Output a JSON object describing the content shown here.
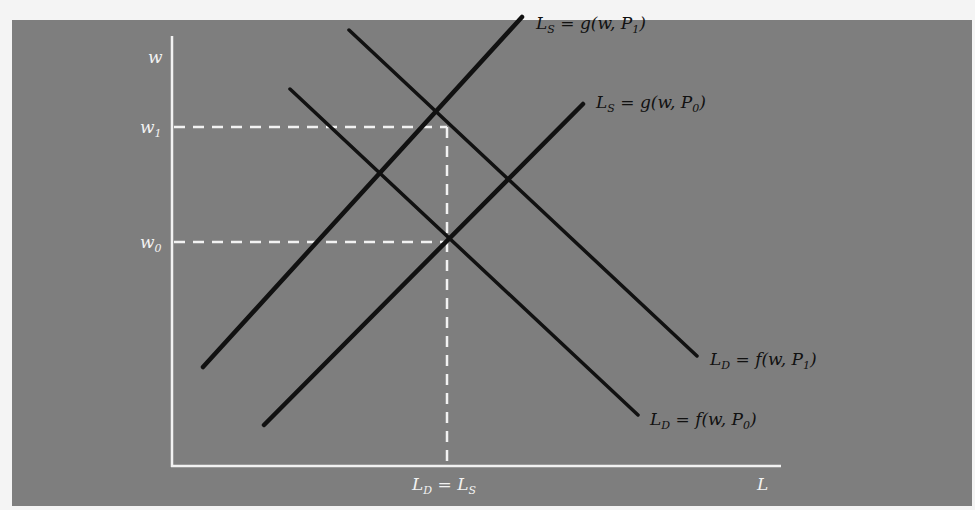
{
  "diagram": {
    "colors": {
      "page_background": "#f4f4f4",
      "panel_background": "#7e7e7e",
      "axis_color": "#f2f2f2",
      "curve_color": "#111111",
      "guide_line_color": "#f2f2f2"
    },
    "axes": {
      "y_label": "w",
      "x_label": "L",
      "y_ticks": [
        {
          "base": "w",
          "sub": "1",
          "y": 127
        },
        {
          "base": "w",
          "sub": "0",
          "y": 242
        }
      ],
      "x_ticks": [
        {
          "text": "L_D = L_S",
          "lhs_base": "L",
          "lhs_sub": "D",
          "eq": " = ",
          "rhs_base": "L",
          "rhs_sub": "S",
          "x": 447
        }
      ]
    },
    "curves": [
      {
        "id": "supply-p1",
        "label_lhs": "L",
        "label_lhs_sub": "S",
        "label_rhs": " = g(w, P",
        "label_rhs_sub": "1",
        "close": ")",
        "x1": 203,
        "y1": 367,
        "x2": 522,
        "y2": 17
      },
      {
        "id": "supply-p0",
        "label_lhs": "L",
        "label_lhs_sub": "S",
        "label_rhs": " = g(w, P",
        "label_rhs_sub": "0",
        "close": ")",
        "x1": 264,
        "y1": 425,
        "x2": 583,
        "y2": 104
      },
      {
        "id": "demand-p1",
        "label_lhs": "L",
        "label_lhs_sub": "D",
        "label_rhs": " = f(w, P",
        "label_rhs_sub": "1",
        "close": ")",
        "x1": 349,
        "y1": 30,
        "x2": 697,
        "y2": 356
      },
      {
        "id": "demand-p0",
        "label_lhs": "L",
        "label_lhs_sub": "D",
        "label_rhs": " = f(w, P",
        "label_rhs_sub": "0",
        "close": ")",
        "x1": 290,
        "y1": 89,
        "x2": 638,
        "y2": 415
      }
    ],
    "equilibria": [
      {
        "name": "initial",
        "x": 447,
        "y": 242,
        "wage": "w0",
        "quantity": "L_D = L_S"
      },
      {
        "name": "new",
        "x": 447,
        "y": 127,
        "wage": "w1",
        "quantity": "L_D = L_S"
      }
    ]
  }
}
